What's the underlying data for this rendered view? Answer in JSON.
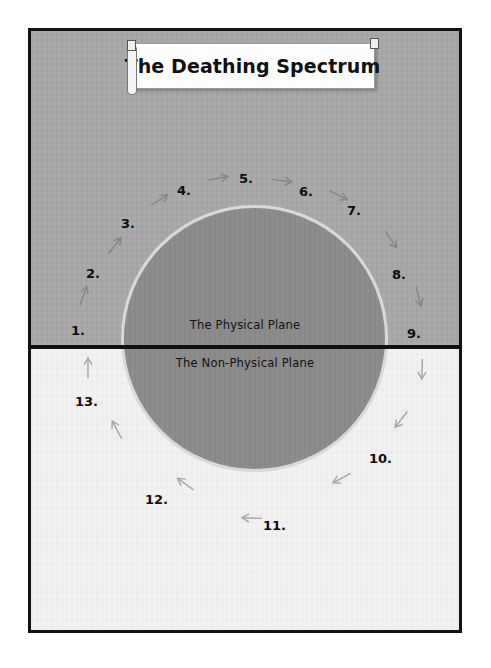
{
  "figure": {
    "title": "The Deathing Spectrum",
    "planes": {
      "upper_label": "The Physical Plane",
      "lower_label": "The Non-Physical Plane"
    },
    "colors": {
      "upper_plane": "#a8a8a8",
      "lower_plane": "#f2f2f2",
      "circle_fill": "#8b8b8b",
      "circle_ring": "#d9d9d9",
      "divider": "#111111",
      "border": "#121212",
      "text": "#0d0d0d"
    },
    "waypoints": [
      {
        "label": "1.",
        "x": 40,
        "y": 292
      },
      {
        "label": "2.",
        "x": 55,
        "y": 235
      },
      {
        "label": "3.",
        "x": 90,
        "y": 185
      },
      {
        "label": "4.",
        "x": 146,
        "y": 152
      },
      {
        "label": "5.",
        "x": 208,
        "y": 140
      },
      {
        "label": "6.",
        "x": 268,
        "y": 153
      },
      {
        "label": "7.",
        "x": 316,
        "y": 172
      },
      {
        "label": "8.",
        "x": 361,
        "y": 236
      },
      {
        "label": "9.",
        "x": 376,
        "y": 295
      },
      {
        "label": "10.",
        "x": 338,
        "y": 420
      },
      {
        "label": "11.",
        "x": 232,
        "y": 487
      },
      {
        "label": "12.",
        "x": 114,
        "y": 461
      },
      {
        "label": "13.",
        "x": 44,
        "y": 363
      }
    ],
    "arrows": [
      {
        "name": "arrow-1-to-2",
        "x": 40,
        "y": 258,
        "rot": -70
      },
      {
        "name": "arrow-2-to-3",
        "x": 72,
        "y": 208,
        "rot": -52
      },
      {
        "name": "arrow-3-to-4",
        "x": 117,
        "y": 163,
        "rot": -33
      },
      {
        "name": "arrow-4-to-5",
        "x": 176,
        "y": 142,
        "rot": -10
      },
      {
        "name": "arrow-5-to-6",
        "x": 240,
        "y": 145,
        "rot": 8
      },
      {
        "name": "arrow-6-to-7",
        "x": 296,
        "y": 160,
        "rot": 27
      },
      {
        "name": "arrow-7-to-8",
        "x": 348,
        "y": 205,
        "rot": 56
      },
      {
        "name": "arrow-8-to-9",
        "x": 375,
        "y": 262,
        "rot": 76
      },
      {
        "name": "arrow-9-to-10",
        "x": 378,
        "y": 335,
        "rot": 92
      },
      {
        "name": "arrow-10-to-11",
        "x": 356,
        "y": 385,
        "rot": 128
      },
      {
        "name": "arrow-11-to-12",
        "x": 296,
        "y": 443,
        "rot": 152
      },
      {
        "name": "arrow-12-to-13",
        "x": 206,
        "y": 482,
        "rot": 182
      },
      {
        "name": "arrow-12-up",
        "x": 140,
        "y": 447,
        "rot": 216
      },
      {
        "name": "arrow-13-up",
        "x": 72,
        "y": 392,
        "rot": 242
      },
      {
        "name": "arrow-13-to-1",
        "x": 44,
        "y": 330,
        "rot": 270
      }
    ]
  }
}
